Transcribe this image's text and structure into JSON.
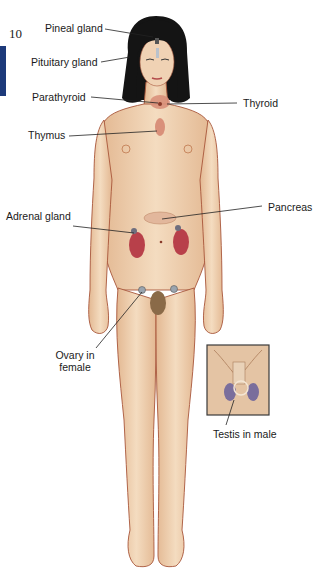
{
  "page": {
    "number": "10",
    "tab_color": "#1d3a7a"
  },
  "diagram": {
    "labels": {
      "pineal": "Pineal gland",
      "pituitary": "Pituitary gland",
      "parathyroid": "Parathyroid",
      "thyroid": "Thyroid",
      "thymus": "Thymus",
      "pancreas": "Pancreas",
      "adrenal": "Adrenal gland",
      "ovary_line1": "Ovary in",
      "ovary_line2": "female",
      "testis": "Testis in male"
    },
    "colors": {
      "skin": "#efd3b3",
      "skin_shadow": "#d9a37c",
      "outline": "#a8563a",
      "hair": "#141414",
      "kidney": "#b8404a",
      "gland": "#d9907a",
      "ovary": "#9aa4ae",
      "testis": "#7a6e9c",
      "leader_line": "#222222"
    }
  }
}
